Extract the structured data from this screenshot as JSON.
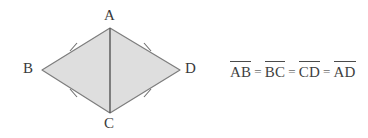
{
  "figure": {
    "shape_name": "rhombus",
    "fill_color": "#dedede",
    "stroke_color": "#7d7d7d",
    "diagonal_color": "#555555",
    "tick_color": "#6e6e6e",
    "label_color": "#3a3a3a",
    "background_color": "#ffffff",
    "vertices": {
      "a": {
        "label": "A",
        "x": 110,
        "y": 28
      },
      "b": {
        "label": "B",
        "x": 42,
        "y": 70
      },
      "c": {
        "label": "C",
        "x": 110,
        "y": 113
      },
      "d": {
        "label": "D",
        "x": 180,
        "y": 70
      }
    },
    "diagonal": {
      "from": "A",
      "to": "C"
    },
    "tick_marks": [
      {
        "edge": "AB",
        "count": 1,
        "x": 73,
        "y": 47
      },
      {
        "edge": "AD",
        "count": 1,
        "x": 147,
        "y": 47
      },
      {
        "edge": "BC",
        "count": 1,
        "x": 73,
        "y": 93
      },
      {
        "edge": "CD",
        "count": 1,
        "x": 147,
        "y": 93
      }
    ]
  },
  "equation": {
    "terms": [
      "AB",
      "BC",
      "CD",
      "AD"
    ],
    "operator": "=",
    "full_text": "AB = BC = CD = AD"
  }
}
